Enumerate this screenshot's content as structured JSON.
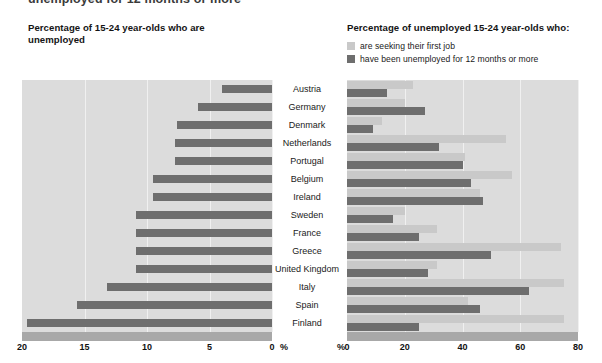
{
  "cut_off_heading": "unemployed for 12 months or more",
  "left_panel": {
    "title": "Percentage of 15-24 year-olds who are unemployed",
    "axis_ticks": [
      "20",
      "15",
      "10",
      "5",
      "0"
    ],
    "axis_unit": "%"
  },
  "right_panel": {
    "title": "Percentage of unemployed 15-24 year-olds who:",
    "legend": [
      {
        "label": "are seeking their first job",
        "color": "#c9c9c9",
        "swatch": "light-square-icon"
      },
      {
        "label": "have been unemployed for 12 months or more",
        "color": "#6e6e6e",
        "swatch": "dark-square-icon"
      }
    ],
    "axis_ticks": [
      "0",
      "20",
      "40",
      "60",
      "80"
    ],
    "axis_unit": "%"
  },
  "colors": {
    "plot_background": "#dcdcdc",
    "axis_bar": "#a8a8a8",
    "gridline": "#f0f0f0",
    "series_light": "#c9c9c9",
    "series_dark": "#6e6e6e"
  },
  "chart_data": {
    "type": "bar",
    "orientation": "horizontal",
    "grid": true,
    "legend_position": "top-right",
    "categories": [
      "Austria",
      "Germany",
      "Denmark",
      "Netherlands",
      "Portugal",
      "Belgium",
      "Ireland",
      "Sweden",
      "France",
      "Greece",
      "United Kingdom",
      "Italy",
      "Spain",
      "Finland"
    ],
    "panels": [
      {
        "name": "left",
        "title": "Percentage of 15-24 year-olds who are unemployed",
        "xlabel": "%",
        "xlim": [
          20,
          0
        ],
        "reversed": true,
        "ticks": [
          20,
          15,
          10,
          5,
          0
        ],
        "series": [
          {
            "name": "unemployed",
            "color": "#6e6e6e",
            "values": [
              4.0,
              5.9,
              7.6,
              7.8,
              7.8,
              9.5,
              9.5,
              10.9,
              10.9,
              10.9,
              10.9,
              13.2,
              15.6,
              19.6
            ]
          }
        ]
      },
      {
        "name": "right",
        "title": "Percentage of unemployed 15-24 year-olds who:",
        "xlabel": "%",
        "xlim": [
          0,
          80
        ],
        "ticks": [
          0,
          20,
          40,
          60,
          80
        ],
        "series": [
          {
            "name": "are seeking their first job",
            "color": "#c9c9c9",
            "values": [
              23,
              20,
              12,
              55,
              41,
              57,
              46,
              20,
              31,
              74,
              31,
              75,
              42,
              75
            ]
          },
          {
            "name": "have been unemployed for 12 months or more",
            "color": "#6e6e6e",
            "values": [
              14,
              27,
              9,
              32,
              40,
              43,
              47,
              16,
              25,
              50,
              28,
              63,
              46,
              25
            ]
          }
        ]
      }
    ]
  }
}
